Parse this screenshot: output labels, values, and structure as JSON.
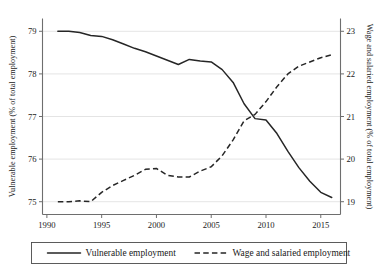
{
  "chart_data": {
    "type": "line",
    "title": "",
    "xlabel": "",
    "ylabel": "Vulnerable employment (% of total employment)",
    "y2label": "Wage and salaried employment (% of total employment)",
    "grid": true,
    "legend_position": "bottom",
    "xlim": [
      1989.0,
      1917.0
    ],
    "x_ticks": [
      1990,
      1995,
      2000,
      2005,
      2010,
      2015
    ],
    "x_tick_labels": [
      "1990",
      "1995",
      "2000",
      "2005",
      "2010",
      "2015"
    ],
    "ylim": [
      74.7,
      79.3
    ],
    "y_ticks": [
      75,
      76,
      77,
      78,
      79
    ],
    "y_tick_labels": [
      "75",
      "76",
      "77",
      "78",
      "79"
    ],
    "y2lim": [
      18.7,
      23.3
    ],
    "y2_ticks": [
      19,
      20,
      21,
      22,
      23
    ],
    "y2_tick_labels": [
      "19",
      "20",
      "21",
      "22",
      "23"
    ],
    "x": [
      1991,
      1992,
      1993,
      1994,
      1995,
      1996,
      1997,
      1998,
      1999,
      2000,
      2001,
      2002,
      2003,
      2004,
      2005,
      2006,
      2007,
      2008,
      2009,
      2010,
      2011,
      2012,
      2013,
      2014,
      2015,
      2016
    ],
    "series": [
      {
        "name": "Vulnerable employment",
        "axis": "left",
        "style": "solid",
        "values": [
          79.0,
          79.0,
          78.97,
          78.9,
          78.88,
          78.8,
          78.7,
          78.6,
          78.52,
          78.42,
          78.32,
          78.22,
          78.34,
          78.3,
          78.28,
          78.1,
          77.8,
          77.3,
          76.95,
          76.92,
          76.6,
          76.18,
          75.8,
          75.48,
          75.22,
          75.1
        ]
      },
      {
        "name": "Wage and salaried employment",
        "axis": "right",
        "style": "dashed",
        "values": [
          19.0,
          19.0,
          19.02,
          19.0,
          19.22,
          19.38,
          19.5,
          19.62,
          19.76,
          19.78,
          19.62,
          19.58,
          19.58,
          19.72,
          19.82,
          20.08,
          20.45,
          20.9,
          21.05,
          21.35,
          21.7,
          22.0,
          22.18,
          22.28,
          22.38,
          22.45
        ]
      }
    ]
  },
  "legend": {
    "items": [
      {
        "label": "Vulnerable employment",
        "style": "solid"
      },
      {
        "label": "Wage and salaried employment",
        "style": "dashed"
      }
    ]
  }
}
